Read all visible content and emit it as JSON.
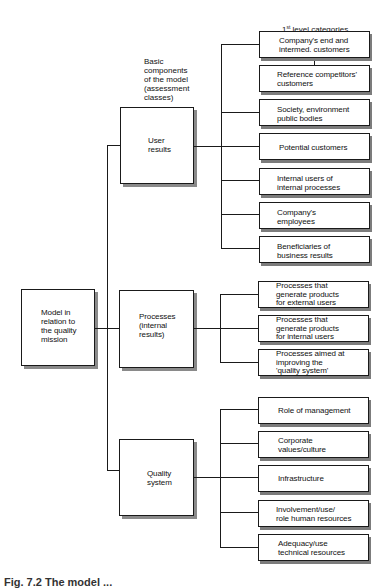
{
  "header": {
    "level1_label_prefix": "1",
    "level1_label_sup": "st",
    "level1_label_suffix": " level categories",
    "basic_components_label": "Basic\ncomponents\nof the model\n(assessment\nclasses)"
  },
  "root": {
    "label": "Model in\nrelation to\nthe quality\nmission"
  },
  "components": [
    {
      "label": "User\nresults",
      "categories": [
        "Company's end and\nintermed. customers",
        "Reference competitors'\ncustomers",
        "Society, environment\npublic bodies",
        "Potential customers",
        "Internal users of\ninternal processes",
        "Company's\nemployees",
        "Beneficiaries of\nbusiness results"
      ]
    },
    {
      "label": "Processes\n(internal\nresults)",
      "categories": [
        "Processes that\ngenerate products\nfor external users",
        "Processes that\ngenerate products\nfor internal users",
        "Processes aimed at\nimproving the\n'quality system'"
      ]
    },
    {
      "label": "Quality\nsystem",
      "categories": [
        "Role of management",
        "Corporate\nvalues/culture",
        "Infrastructure",
        "Involvement/use/\nrole human resources",
        "Adequacy/use\ntechnical resources"
      ]
    }
  ],
  "caption": "Fig. 7.2  The model ..."
}
